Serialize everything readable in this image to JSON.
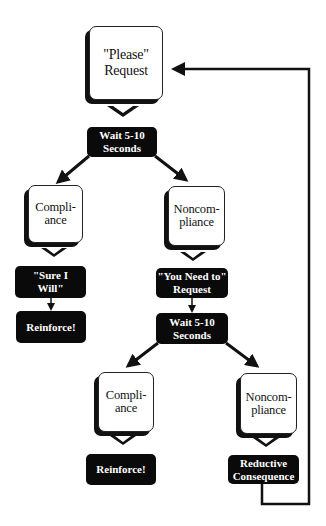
{
  "diagram": {
    "type": "flowchart",
    "nodes": {
      "please_request": {
        "label": "\"Please\"\nRequest",
        "style": "callout"
      },
      "wait1": {
        "label": "Wait  5-10\nSeconds",
        "style": "dark"
      },
      "compliance1": {
        "label": "Compli-\nance",
        "style": "callout"
      },
      "noncompliance1": {
        "label": "Noncom-\npliance",
        "style": "callout"
      },
      "sure_i_will": {
        "label": "\"Sure  I\nWill\"",
        "style": "dark"
      },
      "reinforce1": {
        "label": "Reinforce!",
        "style": "dark"
      },
      "you_need_to": {
        "label": "\"You  Need  to\"\nRequest",
        "style": "dark"
      },
      "wait2": {
        "label": "Wait  5-10\nSeconds",
        "style": "dark"
      },
      "compliance2": {
        "label": "Compli-\nance",
        "style": "callout"
      },
      "noncompliance2": {
        "label": "Noncom-\npliance",
        "style": "callout"
      },
      "reinforce2": {
        "label": "Reinforce!",
        "style": "dark"
      },
      "reductive": {
        "label": "Reductive\nConsequence",
        "style": "dark"
      }
    },
    "edges": [
      [
        "please_request",
        "wait1"
      ],
      [
        "wait1",
        "compliance1"
      ],
      [
        "wait1",
        "noncompliance1"
      ],
      [
        "compliance1",
        "sure_i_will"
      ],
      [
        "sure_i_will",
        "reinforce1"
      ],
      [
        "noncompliance1",
        "you_need_to"
      ],
      [
        "you_need_to",
        "wait2"
      ],
      [
        "wait2",
        "compliance2"
      ],
      [
        "wait2",
        "noncompliance2"
      ],
      [
        "compliance2",
        "reinforce2"
      ],
      [
        "noncompliance2",
        "reductive"
      ],
      [
        "reductive",
        "please_request"
      ]
    ]
  }
}
